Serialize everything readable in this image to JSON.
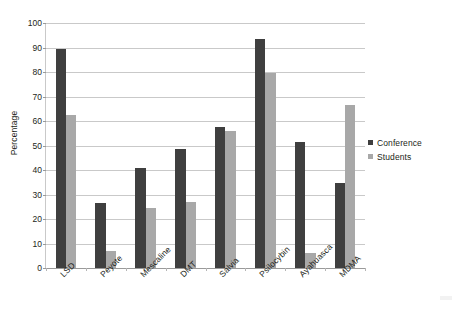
{
  "chart_data": {
    "type": "bar",
    "title": "",
    "xlabel": "",
    "ylabel": "Percentage",
    "ylim": [
      0,
      100
    ],
    "ytick_step": 10,
    "yticks": [
      0,
      10,
      20,
      30,
      40,
      50,
      60,
      70,
      80,
      90,
      100
    ],
    "ytick_labels": [
      "0",
      "10",
      "20",
      "30",
      "40",
      "50",
      "60",
      "70",
      "80",
      "90",
      "100"
    ],
    "grid": true,
    "grid_axis": "y",
    "legend_position": "right",
    "categories": [
      "LSD",
      "Peyote",
      "Mescaline",
      "DMT",
      "Salvia",
      "Psilocybin",
      "Ayahuasca",
      "MDMA"
    ],
    "series": [
      {
        "name": "Conference",
        "color": "#3f3f3f",
        "values": [
          89.5,
          26.5,
          41,
          48.5,
          57.5,
          93.5,
          51.5,
          34.5
        ]
      },
      {
        "name": "Students",
        "color": "#a8a8a8",
        "values": [
          62.5,
          7,
          24.5,
          27,
          56,
          79.5,
          6,
          66.5
        ]
      }
    ]
  },
  "legend": {
    "entries": [
      {
        "label": "Conference",
        "color": "#3f3f3f"
      },
      {
        "label": "Students",
        "color": "#a8a8a8"
      }
    ]
  }
}
